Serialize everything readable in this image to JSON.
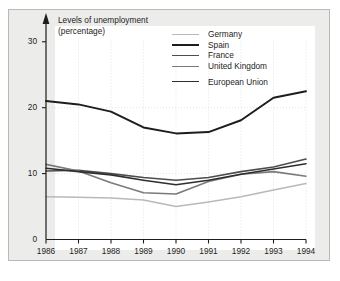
{
  "chart_data": {
    "type": "line",
    "title": "Levels of unemployment",
    "subtitle": "(percentage)",
    "axis_title_line1": "Levels of unemployment",
    "axis_title_line2": "(percentage)",
    "xlabel": "",
    "ylabel": "Levels of unemployment (percentage)",
    "categories": [
      "1986",
      "1987",
      "1988",
      "1989",
      "1990",
      "1991",
      "1992",
      "1993",
      "1994"
    ],
    "x": [
      1986,
      1987,
      1988,
      1989,
      1990,
      1991,
      1992,
      1993,
      1994
    ],
    "xlim": [
      1986,
      1994
    ],
    "ylim": [
      0,
      33
    ],
    "yticks": [
      0,
      10,
      20,
      30
    ],
    "ytick_labels": [
      "0",
      "10",
      "20",
      "30"
    ],
    "grid": "dotted light gridlines at y=10 and y=20 and at each year",
    "legend_position": "top-right inside plot",
    "series": [
      {
        "name": "Germany",
        "color": "#b9b9b9",
        "width": 1.5,
        "values": [
          6.5,
          6.4,
          6.3,
          6.0,
          5.0,
          5.7,
          6.5,
          7.5,
          8.5
        ]
      },
      {
        "name": "Spain",
        "color": "#1d1d1d",
        "width": 2.0,
        "values": [
          21.0,
          20.5,
          19.4,
          17.0,
          16.1,
          16.3,
          18.1,
          21.5,
          22.5
        ]
      },
      {
        "name": "France",
        "color": "#4d4d4d",
        "width": 1.6,
        "values": [
          10.4,
          10.5,
          10.0,
          9.4,
          9.0,
          9.4,
          10.3,
          11.0,
          12.2
        ]
      },
      {
        "name": "United Kingdom",
        "color": "#7a7a7a",
        "width": 1.6,
        "values": [
          11.4,
          10.4,
          8.6,
          7.1,
          6.9,
          8.8,
          9.9,
          10.3,
          9.6
        ]
      },
      {
        "name": "European Union",
        "color": "#2e2e2e",
        "width": 1.6,
        "values": [
          10.8,
          10.3,
          9.8,
          9.0,
          8.3,
          9.0,
          9.9,
          10.7,
          11.5
        ]
      }
    ]
  },
  "colors": {
    "panel_background": "#ececeb",
    "panel_border": "#b9b9b7",
    "plot_background": "#ffffff",
    "axis": "#1d1d1d",
    "gridline": "#d8d8d8",
    "text": "#1d1d1d"
  }
}
